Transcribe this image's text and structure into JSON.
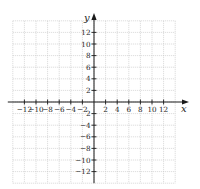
{
  "chart_data": {
    "type": "scatter",
    "title": "",
    "xlabel": "x",
    "ylabel": "y",
    "xlim": [
      -14,
      14
    ],
    "ylim": [
      -14,
      14
    ],
    "grid": true,
    "grid_spacing": 2,
    "x_ticks": [
      -12,
      -10,
      -8,
      -6,
      -4,
      -2,
      2,
      4,
      6,
      8,
      10,
      12
    ],
    "y_ticks": [
      12,
      10,
      8,
      6,
      4,
      2,
      -2,
      -4,
      -6,
      -8,
      -10,
      -12
    ],
    "x_tick_labels": [
      "−12",
      "−10",
      "−8",
      "−6",
      "−4",
      "−2",
      "2",
      "4",
      "6",
      "8",
      "10",
      "12"
    ],
    "y_tick_labels": [
      "12",
      "10",
      "8",
      "6",
      "4",
      "2",
      "2",
      "−4",
      "−6",
      "−8",
      "−10",
      "−12"
    ],
    "series": [],
    "legend": null
  },
  "layout": {
    "origin_px": [
      94,
      102
    ],
    "px_per_unit": 5.8,
    "colors": {
      "grid": "#c8c8c8",
      "axis": "#1a1a1a",
      "text": "#222222"
    }
  }
}
